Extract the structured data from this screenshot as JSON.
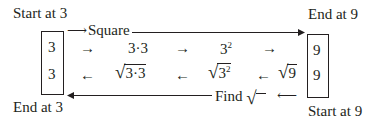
{
  "labels": {
    "start_left": "Start at 3",
    "end_right": "End at 9",
    "end_left": "End at 3",
    "start_right": "Start at 9"
  },
  "top_path": {
    "operation": "Square",
    "box_value": "3",
    "arrow1": "→",
    "step1": "3·3",
    "arrow2": "→",
    "step2_base": "3",
    "step2_exp": "2",
    "arrow3": "→",
    "result": "9"
  },
  "bottom_path": {
    "operation": "Find",
    "operation_symbol": "√",
    "box_value": "9",
    "arrow1": "←",
    "step1": "9",
    "arrow2": "←",
    "step2_base": "3",
    "step2_exp": "2",
    "arrow3": "←",
    "step3": "3·3",
    "arrow4": "←",
    "result": "3"
  },
  "colors": {
    "ink": "#231f20",
    "background": "#ffffff"
  }
}
